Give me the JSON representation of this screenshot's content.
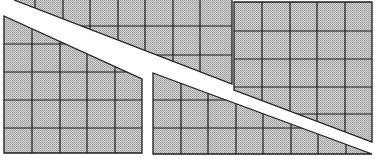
{
  "diagram": {
    "title": "",
    "fill_pattern": "dither-gray",
    "colors": {
      "background": "#ffffff",
      "fill_light": "#d8d8d8",
      "fill_dark": "#9a9a9a",
      "grid_line": "#1e1e1e"
    },
    "cell_size_px": 41,
    "pieces": [
      {
        "id": "top-middle-strip",
        "points": "14,0 232,0 232,85 232,84"
      },
      {
        "id": "left-piece",
        "points": "4,16 142,80 142,153 4,153"
      },
      {
        "id": "middle-bottom-piece",
        "points": "153,73 375,154 153,154"
      },
      {
        "id": "right-piece",
        "points": "234,2 372,2 372,142 234,90"
      }
    ]
  }
}
